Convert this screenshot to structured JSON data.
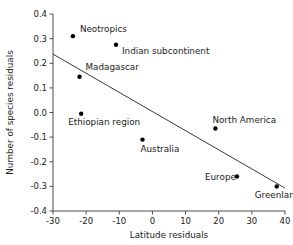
{
  "chart_data": {
    "type": "scatter",
    "title": "",
    "xlabel": "Latitude residuals",
    "ylabel": "Number of species residuals",
    "xlim": [
      -30,
      40
    ],
    "ylim": [
      -0.4,
      0.4
    ],
    "xticks": [
      -30,
      -20,
      -10,
      0,
      10,
      20,
      30,
      40
    ],
    "xticklabels": [
      "-30",
      "-20",
      "-10",
      "0",
      "10",
      "20",
      "30",
      "40"
    ],
    "yticks": [
      0.4,
      0.3,
      0.2,
      0.1,
      0.0,
      -0.1,
      -0.2,
      -0.3,
      -0.4
    ],
    "yticklabels": [
      "0.4",
      "0.3",
      "0.2",
      "0.1",
      "0.0",
      "-0.1",
      "-0.2",
      "-0.3",
      "-0.4"
    ],
    "grid": false,
    "legend": null,
    "points": [
      {
        "label": "Neotropics",
        "x": -24.0,
        "y": 0.31,
        "label_dx": 7,
        "label_dy": -4
      },
      {
        "label": "Indian subcontinent",
        "x": -11.0,
        "y": 0.275,
        "label_dx": 6,
        "label_dy": 9
      },
      {
        "label": "Madagascar",
        "x": -22.0,
        "y": 0.145,
        "label_dx": 6,
        "label_dy": -7
      },
      {
        "label": "Ethiopian region",
        "x": -21.5,
        "y": -0.005,
        "label_dx": -13,
        "label_dy": 11
      },
      {
        "label": "Australia",
        "x": -3.0,
        "y": -0.11,
        "label_dx": -2,
        "label_dy": 12
      },
      {
        "label": "North America",
        "x": 19.0,
        "y": -0.065,
        "label_dx": -3,
        "label_dy": -6
      },
      {
        "label": "Europe",
        "x": 25.5,
        "y": -0.26,
        "label_dx": -32,
        "label_dy": 3
      },
      {
        "label": "Greenland",
        "x": 37.5,
        "y": -0.3,
        "label_dx": -22,
        "label_dy": 12
      }
    ],
    "trendline": {
      "x0": -30,
      "y0": 0.237,
      "x1": 40,
      "y1": -0.307
    }
  }
}
